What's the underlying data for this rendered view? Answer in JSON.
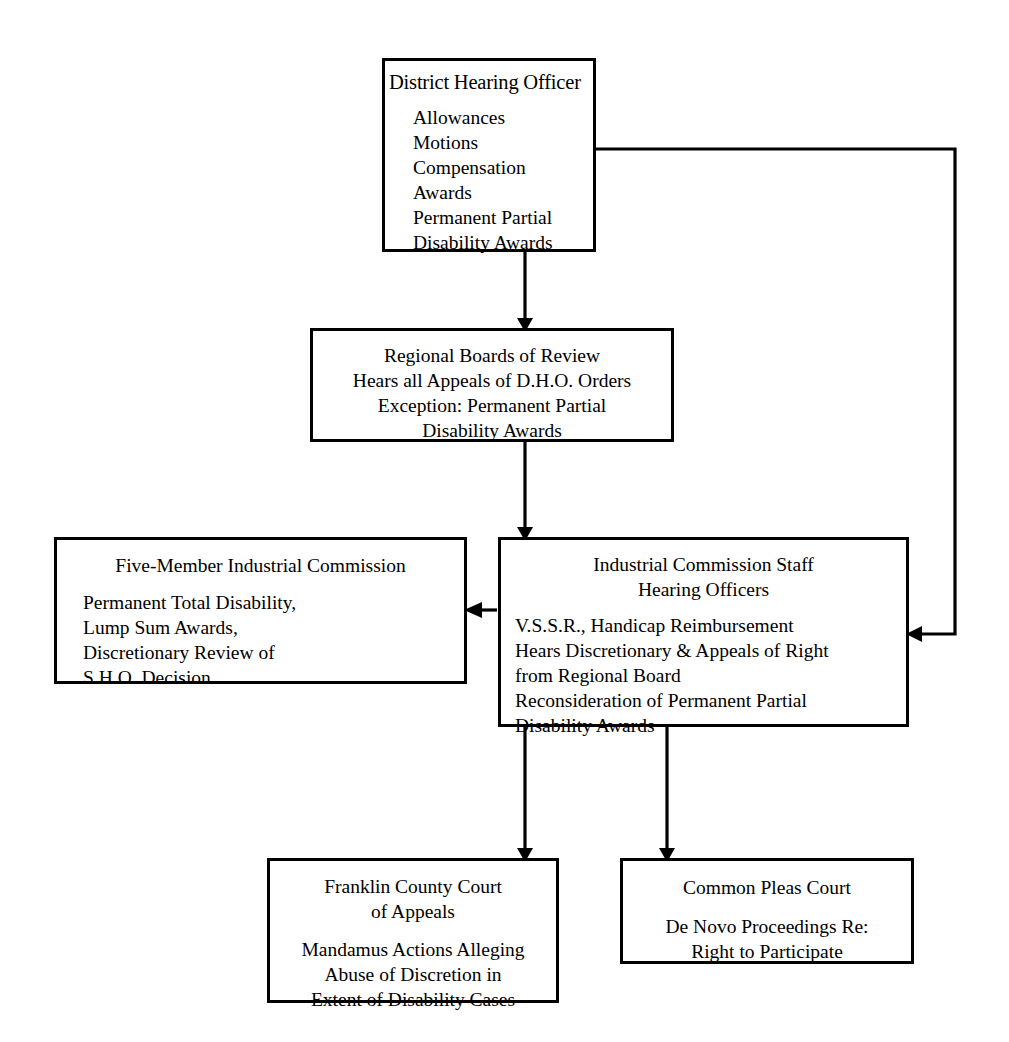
{
  "diagram": {
    "line_color": "#000000",
    "box_border_color": "#000000",
    "background_color": "#ffffff",
    "nodes": [
      {
        "id": "dho",
        "header": "District Hearing Officer",
        "body": "Allowances\nMotions\nCompensation\n Awards\nPermanent Partial\n Disability Awards"
      },
      {
        "id": "rbr",
        "header": "Regional Boards of Review\nHears all Appeals of D.H.O. Orders\nException: Permanent Partial\nDisability Awards",
        "body": ""
      },
      {
        "id": "fmic",
        "header": "Five-Member Industrial Commission",
        "body": "Permanent Total Disability,\nLump Sum Awards,\nDiscretionary Review of\nS.H.O. Decision"
      },
      {
        "id": "ics",
        "header": "Industrial Commission Staff\nHearing Officers",
        "body": "V.S.S.R., Handicap Reimbursement\nHears Discretionary & Appeals of Right\n from Regional Board\nReconsideration of Permanent Partial\n Disability Awards"
      },
      {
        "id": "fcca",
        "header": "Franklin County Court\nof Appeals",
        "body": "Mandamus Actions Alleging\nAbuse of Discretion in\nExtent of Disability Cases"
      },
      {
        "id": "cpc",
        "header": "Common Pleas Court",
        "body": "De Novo Proceedings Re:\nRight to Participate"
      }
    ],
    "connectors": [
      {
        "id": "dho-to-rbr",
        "from": "dho",
        "to": "rbr",
        "style": "straight-down",
        "arrow": "down"
      },
      {
        "id": "dho-to-ics",
        "from": "dho",
        "to": "ics",
        "style": "right-then-down-then-left",
        "arrow": "left"
      },
      {
        "id": "rbr-to-ics",
        "from": "rbr",
        "to": "ics",
        "style": "straight-down",
        "arrow": "down"
      },
      {
        "id": "ics-to-fmic",
        "from": "ics",
        "to": "fmic",
        "style": "straight-left",
        "arrow": "left"
      },
      {
        "id": "ics-to-fcca",
        "from": "ics",
        "to": "fcca",
        "style": "straight-down",
        "arrow": "down"
      },
      {
        "id": "ics-to-cpc",
        "from": "ics",
        "to": "cpc",
        "style": "straight-down",
        "arrow": "down"
      }
    ]
  }
}
